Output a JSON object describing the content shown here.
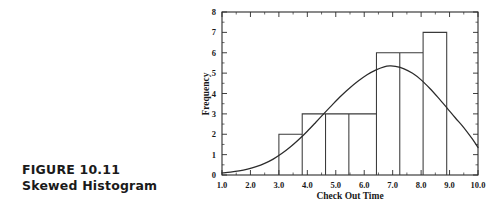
{
  "caption": {
    "figure_number": "FIGURE 10.11",
    "figure_title": "Skewed Histogram"
  },
  "chart_data": {
    "type": "bar",
    "title": "",
    "subtitle": "",
    "xlabel": "Check Out Time",
    "ylabel": "Frequency",
    "xlim": [
      1.0,
      10.0
    ],
    "ylim": [
      0,
      8
    ],
    "grid": false,
    "legend": "none",
    "xticks": [
      "1.0",
      "2.0",
      "3.0",
      "4.0",
      "5.0",
      "6.0",
      "7.0",
      "8.0",
      "9.0",
      "10.0"
    ],
    "xtick_values": [
      1.0,
      2.0,
      3.0,
      4.0,
      5.0,
      6.0,
      7.0,
      8.0,
      9.0,
      10.0
    ],
    "yticks": [
      "0",
      "1",
      "2",
      "3",
      "4",
      "5",
      "6",
      "7",
      "8"
    ],
    "ytick_values": [
      0,
      1,
      2,
      3,
      4,
      5,
      6,
      7,
      8
    ],
    "bin_edges": [
      3.0,
      3.82,
      4.64,
      5.46,
      6.43,
      7.25,
      8.07,
      8.9
    ],
    "categories": [
      "3.00-3.82",
      "3.82-4.64",
      "4.64-5.46",
      "5.46-6.43",
      "6.43-7.25",
      "7.25-8.07",
      "8.07-8.90"
    ],
    "values": [
      2,
      3,
      3,
      3,
      6,
      6,
      7
    ],
    "overlay_curve": {
      "name": "smoothed frequency curve",
      "peak_x": 6.8,
      "peak_y": 5.35,
      "start_point": [
        1.0,
        0.1
      ],
      "end_point": [
        10.0,
        1.35
      ],
      "points": [
        [
          1.0,
          0.1
        ],
        [
          1.3,
          0.14
        ],
        [
          1.6,
          0.2
        ],
        [
          1.9,
          0.29
        ],
        [
          2.2,
          0.41
        ],
        [
          2.5,
          0.57
        ],
        [
          2.8,
          0.78
        ],
        [
          3.1,
          1.05
        ],
        [
          3.4,
          1.37
        ],
        [
          3.7,
          1.74
        ],
        [
          4.0,
          2.15
        ],
        [
          4.3,
          2.59
        ],
        [
          4.6,
          3.04
        ],
        [
          4.9,
          3.48
        ],
        [
          5.2,
          3.9
        ],
        [
          5.5,
          4.28
        ],
        [
          5.8,
          4.62
        ],
        [
          6.1,
          4.92
        ],
        [
          6.4,
          5.15
        ],
        [
          6.7,
          5.31
        ],
        [
          6.9,
          5.35
        ],
        [
          7.1,
          5.33
        ],
        [
          7.4,
          5.21
        ],
        [
          7.7,
          4.99
        ],
        [
          8.0,
          4.67
        ],
        [
          8.3,
          4.26
        ],
        [
          8.6,
          3.8
        ],
        [
          8.9,
          3.31
        ],
        [
          9.2,
          2.81
        ],
        [
          9.5,
          2.33
        ],
        [
          9.8,
          1.77
        ],
        [
          10.0,
          1.35
        ]
      ]
    },
    "colors": {
      "bar_stroke": "#3a3a3a",
      "bar_fill": "#ffffff",
      "curve": "#2b2b2b",
      "axis": "#2b2b2b",
      "background": "#ffffff",
      "text": "#1a1a1a"
    }
  }
}
